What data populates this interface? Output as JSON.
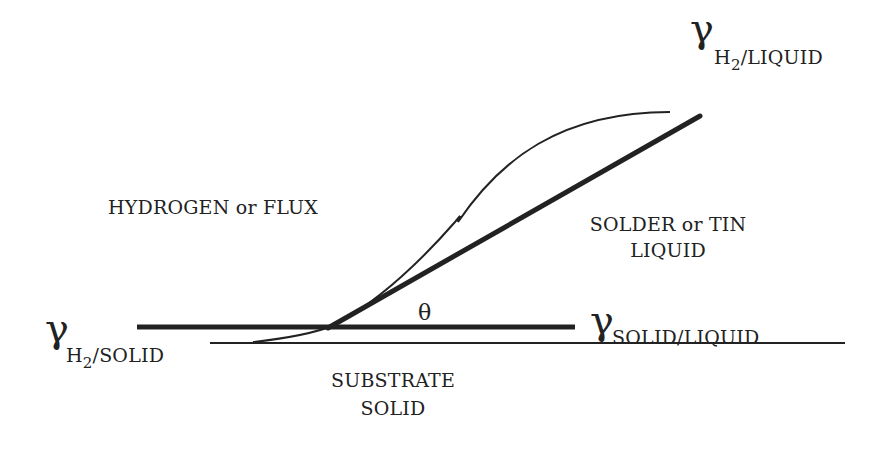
{
  "diagram": {
    "type": "wetting-contact-angle",
    "labels": {
      "gamma_h2_liquid": {
        "symbol": "γ",
        "sub_main": "H",
        "sub_index": "2",
        "sub_rest": "/LIQUID"
      },
      "gamma_h2_solid": {
        "symbol": "γ",
        "sub_main": "H",
        "sub_index": "2",
        "sub_rest": "/SOLID"
      },
      "gamma_solid_liquid": {
        "symbol": "γ",
        "sub_text": "SOLID/LIQUID"
      },
      "theta": "θ",
      "ambient": "HYDROGEN or FLUX",
      "liquid_line1": "SOLDER or TIN",
      "liquid_line2": "LIQUID",
      "substrate_line1": "SUBSTRATE",
      "substrate_line2": "SOLID"
    },
    "colors": {
      "ink": "#222222",
      "background": "#ffffff"
    }
  }
}
